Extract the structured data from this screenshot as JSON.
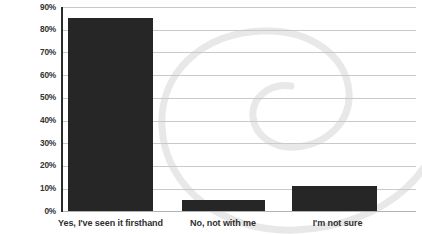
{
  "chart_data": {
    "type": "bar",
    "title": "",
    "subtitle": "",
    "xlabel": "",
    "ylabel": "",
    "categories": [
      "Yes, I've seen it firsthand",
      "No, not with me",
      "I'm not sure"
    ],
    "values": [
      85,
      5,
      11
    ],
    "ylim": [
      0,
      90
    ],
    "y_ticks": [
      "0%",
      "10%",
      "20%",
      "30%",
      "40%",
      "50%",
      "60%",
      "70%",
      "80%",
      "90%"
    ],
    "y_tick_values": [
      0,
      10,
      20,
      30,
      40,
      50,
      60,
      70,
      80,
      90
    ],
    "grid": true,
    "legend": false,
    "legend_position": "none",
    "bar_color": "#262626",
    "gridline_color": "#c9c9c9",
    "axis_color": "#2b2b2b",
    "label_color": "#2f2f2f",
    "background_color": "#ffffff",
    "watermark_color": "#e8e8e8",
    "watermark": "spiral-swirl"
  }
}
